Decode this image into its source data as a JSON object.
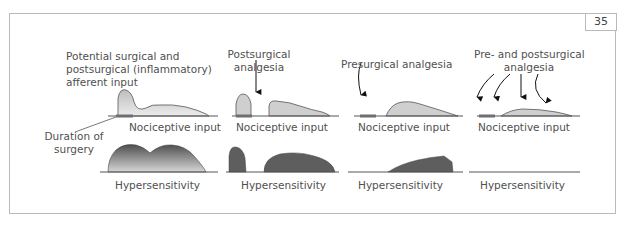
{
  "figure": {
    "number": "35",
    "colors": {
      "frame_border": "#b9b9b9",
      "input_fill_light": "#d4d4d4",
      "hyper_fill_dark": "#5e5e5e",
      "surgery_bar": "#6f6f6f",
      "text": "#505050"
    },
    "panels": [
      {
        "id": "no-analgesia",
        "title": "Potential surgical and postsurgical (inflammatory) afferent input",
        "title_lines": [
          "Potential surgical and",
          "postsurgical (inflammatory)",
          "afferent input"
        ],
        "callout": [
          "Duration of",
          "surgery"
        ],
        "nociceptive_label": "Nociceptive input",
        "hypersensitivity_label": "Hypersensitivity"
      },
      {
        "id": "postsurgical",
        "title_lines": [
          "Postsurgical",
          "analgesia"
        ],
        "nociceptive_label": "Nociceptive input",
        "hypersensitivity_label": "Hypersensitivity"
      },
      {
        "id": "presurgical",
        "title_lines": [
          "Presurgical analgesia"
        ],
        "nociceptive_label": "Nociceptive input",
        "hypersensitivity_label": "Hypersensitivity"
      },
      {
        "id": "pre-and-post",
        "title_lines": [
          "Pre- and postsurgical",
          "analgesia"
        ],
        "nociceptive_label": "Nociceptive input",
        "hypersensitivity_label": "Hypersensitivity"
      }
    ]
  }
}
